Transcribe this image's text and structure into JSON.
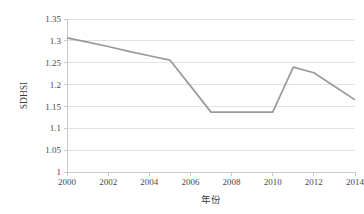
{
  "chart_data": {
    "type": "line",
    "title": "",
    "subtitle": "",
    "xlabel": "年份",
    "ylabel": "SDHSI",
    "xlim": [
      2000,
      2014
    ],
    "ylim": [
      1,
      1.35
    ],
    "grid": true,
    "legend": false,
    "legend_position": "none",
    "line_color": "#9a9a9a",
    "grid_color": "#d9d9d9",
    "axis_color": "#c4c4c4",
    "x": [
      2000,
      2001,
      2002,
      2003,
      2004,
      2005,
      2006,
      2007,
      2008,
      2009,
      2010,
      2011,
      2012,
      2013,
      2014
    ],
    "values": [
      1.307,
      1.297,
      1.287,
      1.276,
      1.266,
      1.256,
      1.197,
      1.137,
      1.137,
      1.137,
      1.137,
      1.24,
      1.227,
      1.196,
      1.165
    ],
    "series": [
      {
        "name": "SDHSI",
        "values": [
          1.307,
          1.297,
          1.287,
          1.276,
          1.266,
          1.256,
          1.197,
          1.137,
          1.137,
          1.137,
          1.137,
          1.24,
          1.227,
          1.196,
          1.165
        ]
      }
    ],
    "xticks": [
      2000,
      2002,
      2004,
      2006,
      2008,
      2010,
      2012,
      2014
    ],
    "xticklabels": [
      "2000",
      "2002",
      "2004",
      "2006",
      "2008",
      "2010",
      "2012",
      "2014"
    ],
    "yticks": [
      1,
      1.05,
      1.1,
      1.15,
      1.2,
      1.25,
      1.3,
      1.35
    ],
    "yticklabels": [
      "1",
      "1.05",
      "1.1",
      "1.15",
      "1.2",
      "1.25",
      "1.3",
      "1.35"
    ],
    "annotations": []
  }
}
